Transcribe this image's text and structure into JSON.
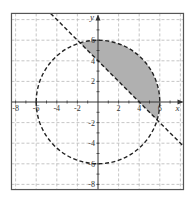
{
  "chart_data": {
    "type": "line",
    "title": "",
    "xlabel": "x",
    "ylabel": "y",
    "xlim": [
      -8.4,
      8.3
    ],
    "ylim": [
      -8.5,
      8.6
    ],
    "grid": true,
    "grid_style": "dashed",
    "grid_step": 2,
    "x_ticks": [
      -8,
      -6,
      -4,
      -2,
      2,
      4,
      6
    ],
    "y_ticks": [
      -8,
      -6,
      -4,
      -2,
      2,
      4,
      6
    ],
    "x_tick_labels": [
      "-8",
      "-6",
      "-4",
      "-2",
      "2",
      "4",
      "6"
    ],
    "y_tick_labels": [
      "-8",
      "-6",
      "-4",
      "-2",
      "2",
      "4",
      "6"
    ],
    "series": [
      {
        "name": "circle",
        "equation": "x^2 + y^2 = 36",
        "style": "dashed",
        "center": [
          0,
          0
        ],
        "radius": 6
      },
      {
        "name": "line",
        "equation": "y = -x + 4",
        "style": "dashed",
        "slope": -1,
        "intercept": 4
      }
    ],
    "shaded_region": {
      "description": "inside circle and above line",
      "inequalities": [
        "x^2 + y^2 < 36",
        "y > -x + 4"
      ],
      "fill": "#b0b0b0"
    },
    "intersections": [
      [
        -1.74,
        5.74
      ],
      [
        5.74,
        -1.74
      ]
    ]
  },
  "colors": {
    "frame": "#555555",
    "grid": "#b8b8b8",
    "axis": "#333333",
    "curve": "#222222",
    "shade": "#b0b0b0"
  }
}
